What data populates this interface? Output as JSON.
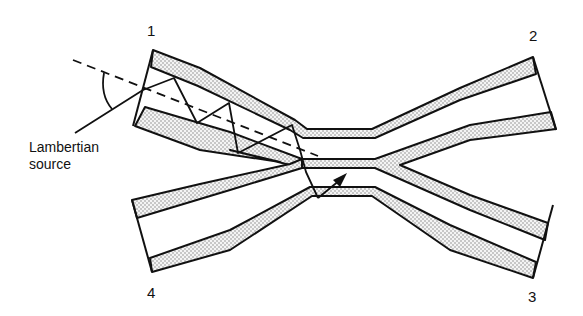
{
  "figure": {
    "ports": [
      {
        "id": "1",
        "label": "1"
      },
      {
        "id": "2",
        "label": "2"
      },
      {
        "id": "3",
        "label": "3"
      },
      {
        "id": "4",
        "label": "4"
      }
    ],
    "annotation": {
      "line1": "Lambertian",
      "line2": "source"
    },
    "colors": {
      "stroke": "#111111",
      "cladding_fill": "#e6e6e6",
      "background": "#ffffff"
    }
  }
}
